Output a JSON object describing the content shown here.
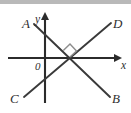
{
  "figure": {
    "background_color": "#ffffff",
    "top_band_color": "#b9b9b9",
    "line_color": "#3a3a3a",
    "axis_color": "#2b2b2b",
    "angle_mark_color": "#8d8d8d"
  },
  "axes": {
    "x_label": "x",
    "y_label": "y",
    "origin_label": "0",
    "origin": {
      "x": 45,
      "y": 58
    },
    "x_axis": {
      "x1": 8,
      "y1": 58,
      "x2": 122,
      "y2": 58,
      "arrow_at": "right"
    },
    "y_axis": {
      "x1": 45,
      "y1": 103,
      "x2": 45,
      "y2": 13,
      "arrow_at": "top"
    }
  },
  "lines": [
    {
      "name": "line-AB",
      "from_label": "A",
      "to_label": "B",
      "from": {
        "x": 34,
        "y": 24
      },
      "to": {
        "x": 110,
        "y": 97
      },
      "direction": "descending"
    },
    {
      "name": "line-CD",
      "from_label": "C",
      "to_label": "D",
      "from": {
        "x": 24,
        "y": 97
      },
      "to": {
        "x": 111,
        "y": 23
      },
      "direction": "ascending"
    }
  ],
  "labels": {
    "A": {
      "text": "A",
      "x": 22,
      "y": 28
    },
    "B": {
      "text": "B",
      "x": 112,
      "y": 103
    },
    "C": {
      "text": "C",
      "x": 10,
      "y": 103
    },
    "D": {
      "text": "D",
      "x": 113,
      "y": 28
    },
    "x": {
      "text": "x",
      "x": 122,
      "y": 69
    },
    "y": {
      "text": "y",
      "x": 36,
      "y": 22
    },
    "origin": {
      "text": "0",
      "x": 36,
      "y": 70
    }
  },
  "angle_marker": {
    "name": "right-angle-marker",
    "intersection": {
      "x": 70,
      "y": 57
    },
    "size": 9,
    "description": "right angle square between line AB and line CD"
  }
}
